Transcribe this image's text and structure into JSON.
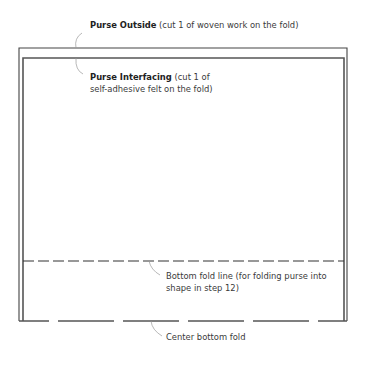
{
  "diagram": {
    "type": "sewing-pattern",
    "labels": {
      "purse_outside": {
        "title": "Purse Outside",
        "note": " (cut 1 of woven work on the fold)"
      },
      "purse_interfacing": {
        "title": "Purse Interfacing",
        "note_line1": " (cut 1 of",
        "note_line2": "self-adhesive felt on the fold)"
      },
      "bottom_fold_line": {
        "line1": "Bottom fold line (for folding purse into",
        "line2": "shape in step 12)"
      },
      "center_bottom_fold": {
        "text": "Center bottom fold"
      }
    },
    "colors": {
      "outline": "#555555",
      "leader": "#999999",
      "text": "#3a3a3a"
    }
  }
}
